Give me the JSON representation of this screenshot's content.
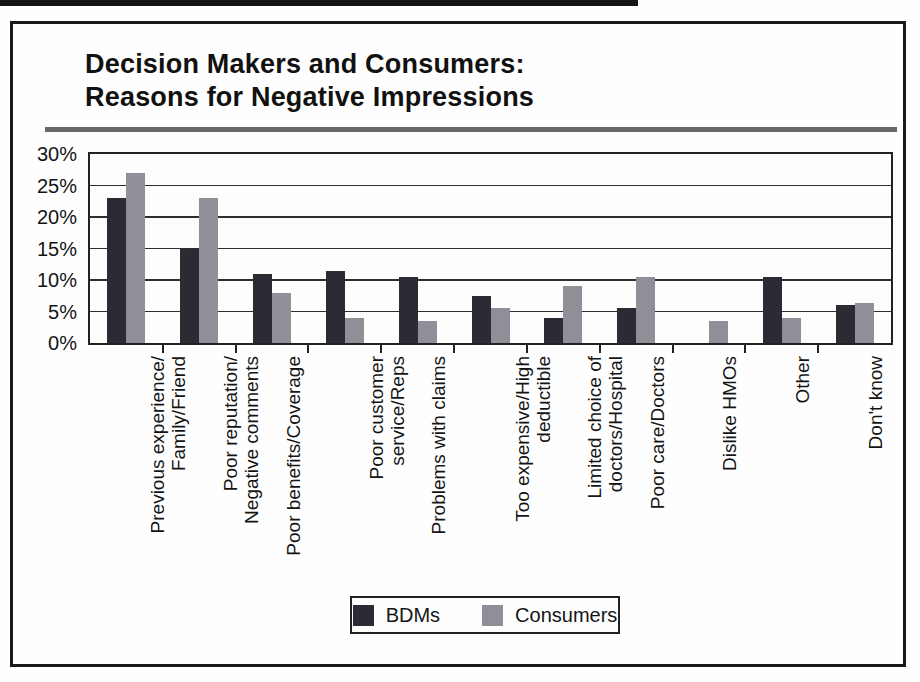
{
  "header": {
    "title_line1": "Decision Makers and Consumers:",
    "title_line2": "Reasons for Negative Impressions"
  },
  "chart_data": {
    "type": "bar",
    "title": "Decision Makers and Consumers: Reasons for Negative Impressions",
    "categories": [
      "Previous experience/\nFamily/Friend",
      "Poor reputation/\nNegative comments",
      "Poor benefits/Coverage",
      "Poor customer\nservice/Reps",
      "Problems with claims",
      "Too expensive/High\ndeductible",
      "Limited choice of\ndoctors/Hospital",
      "Poor care/Doctors",
      "Dislike HMOs",
      "Other",
      "Don't know"
    ],
    "series": [
      {
        "name": "BDMs",
        "color": "#2b2b33",
        "values": [
          23,
          15,
          11,
          11.5,
          10.5,
          7.5,
          4,
          5.5,
          0,
          10.5,
          6
        ]
      },
      {
        "name": "Consumers",
        "color": "#8f8f97",
        "values": [
          27,
          23,
          8,
          4,
          3.5,
          5.5,
          9,
          10.5,
          3.5,
          4,
          6.3
        ]
      }
    ],
    "xlabel": "",
    "ylabel": "",
    "ylim": [
      0,
      30
    ],
    "ytick_labels": [
      "0%",
      "5%",
      "10%",
      "15%",
      "20%",
      "25%",
      "30%"
    ],
    "grid": true,
    "legend_position": "bottom"
  }
}
